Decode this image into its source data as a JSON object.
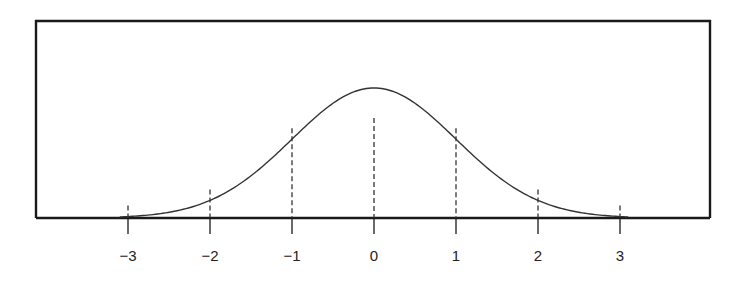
{
  "chart_data": {
    "type": "line",
    "title": "",
    "xlabel": "",
    "ylabel": "",
    "x_ticks": [
      -3,
      -2,
      -1,
      0,
      1,
      2,
      3
    ],
    "tick_labels": [
      "−3",
      "−2",
      "−1",
      "0",
      "1",
      "2",
      "3"
    ],
    "xlim": [
      -4.2,
      4.05
    ],
    "grid": false,
    "legend": null,
    "series": [
      {
        "name": "normal density",
        "function": "standard normal pdf",
        "mean": 0,
        "sd": 1,
        "x": [
          -3.1,
          -3,
          -2.5,
          -2,
          -1.5,
          -1,
          -0.5,
          0,
          0.5,
          1,
          1.5,
          2,
          2.5,
          3,
          3.1
        ],
        "y": [
          0.0033,
          0.0044,
          0.0175,
          0.054,
          0.1295,
          0.242,
          0.3521,
          0.3989,
          0.3521,
          0.242,
          0.1295,
          0.054,
          0.0175,
          0.0044,
          0.0033
        ]
      }
    ],
    "reference_lines": [
      {
        "x": -3,
        "style": "dashed"
      },
      {
        "x": -2,
        "style": "dashed"
      },
      {
        "x": -1,
        "style": "dashed"
      },
      {
        "x": 0,
        "style": "dashed"
      },
      {
        "x": 1,
        "style": "dashed"
      },
      {
        "x": 2,
        "style": "dashed"
      },
      {
        "x": 3,
        "style": "dashed"
      }
    ]
  },
  "colors": {
    "frame": "#1a1a1a",
    "curve": "#333333",
    "dashes": "#333333",
    "text": "#222222",
    "background": "#ffffff"
  }
}
